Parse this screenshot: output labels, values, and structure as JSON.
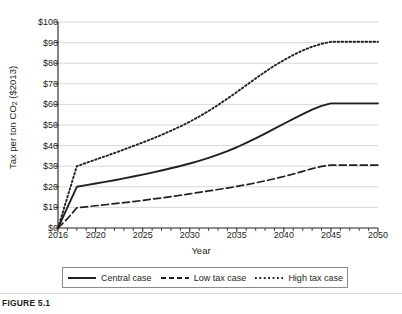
{
  "figure": {
    "caption": "FIGURE 5.1"
  },
  "chart_data": {
    "type": "line",
    "title": "",
    "xlabel": "Year",
    "ylabel": "Tax per ton CO2 ($2013)",
    "ylabel_main": "Tax per ton CO",
    "ylabel_sub": "2",
    "ylabel_tail": " ($2013)",
    "xlim": [
      2016,
      2050
    ],
    "ylim": [
      0,
      100
    ],
    "grid": "horizontal",
    "legend_position": "bottom",
    "ytick_values": [
      0,
      10,
      20,
      30,
      40,
      50,
      60,
      70,
      80,
      90,
      100
    ],
    "ytick_labels": [
      "$0",
      "$10",
      "$20",
      "$30",
      "$40",
      "$50",
      "$60",
      "$70",
      "$80",
      "$90",
      "$100"
    ],
    "xtick_values": [
      2016,
      2020,
      2025,
      2030,
      2035,
      2040,
      2045,
      2050
    ],
    "xtick_labels": [
      "2016",
      "2020",
      "2025",
      "2030",
      "2035",
      "2040",
      "2045",
      "2050"
    ],
    "x_minor_tick_interval": 1,
    "x": [
      2016,
      2017,
      2018,
      2019,
      2020,
      2021,
      2022,
      2023,
      2024,
      2025,
      2026,
      2027,
      2028,
      2029,
      2030,
      2031,
      2032,
      2033,
      2034,
      2035,
      2036,
      2037,
      2038,
      2039,
      2040,
      2041,
      2042,
      2043,
      2044,
      2045,
      2046,
      2047,
      2048,
      2049,
      2050
    ],
    "series": [
      {
        "name": "Central case",
        "style": "solid",
        "color": "#231f20",
        "values": [
          0,
          10,
          20,
          20.8,
          21.6,
          22.4,
          23.2,
          24.1,
          25.0,
          25.9,
          26.9,
          27.9,
          29.0,
          30.1,
          31.3,
          32.6,
          34.0,
          35.6,
          37.3,
          39.2,
          41.3,
          43.5,
          45.8,
          48.2,
          50.6,
          53.0,
          55.3,
          57.5,
          59.3,
          60.5,
          60.5,
          60.5,
          60.5,
          60.5,
          60.5
        ]
      },
      {
        "name": "Low tax case",
        "style": "dashed",
        "color": "#231f20",
        "values": [
          0,
          4.5,
          9.8,
          10.3,
          10.8,
          11.3,
          11.8,
          12.3,
          12.8,
          13.4,
          14.0,
          14.6,
          15.2,
          15.9,
          16.6,
          17.3,
          18.0,
          18.7,
          19.4,
          20.2,
          21.0,
          21.9,
          22.9,
          23.9,
          25.0,
          26.2,
          27.5,
          28.8,
          29.9,
          30.5,
          30.5,
          30.5,
          30.5,
          30.5,
          30.5
        ]
      },
      {
        "name": "High tax case",
        "style": "dotted",
        "color": "#231f20",
        "values": [
          0,
          15,
          30,
          31.6,
          33.2,
          34.8,
          36.4,
          38.1,
          39.8,
          41.5,
          43.3,
          45.2,
          47.2,
          49.3,
          51.6,
          54.1,
          56.8,
          59.7,
          62.8,
          66.0,
          69.3,
          72.6,
          75.8,
          78.8,
          81.5,
          84.0,
          86.2,
          88.0,
          89.4,
          90.4,
          90.4,
          90.4,
          90.4,
          90.4,
          90.4
        ]
      }
    ]
  },
  "legend": {
    "items": [
      {
        "label": "Central case",
        "style": "solid"
      },
      {
        "label": "Low tax case",
        "style": "dashed"
      },
      {
        "label": "High tax case",
        "style": "dotted"
      }
    ]
  }
}
